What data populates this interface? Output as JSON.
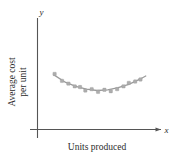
{
  "figure": {
    "name": "average-cost-per-unit-scatterplot",
    "background_color": "#ffffff"
  },
  "axes": {
    "x_axis_symbol": "x",
    "y_axis_symbol": "y",
    "x_axis_title": "Units produced",
    "y_axis_title_line1": "Average cost",
    "y_axis_title_line2": "per unit",
    "axis_color": "#555555"
  },
  "chart_data": {
    "type": "scatter",
    "title": "",
    "xlabel": "Units produced",
    "ylabel": "Average cost per unit",
    "xlim": [
      0,
      10
    ],
    "ylim": [
      0,
      10
    ],
    "grid": false,
    "legend": null,
    "axis_tick_labels": {
      "x": [],
      "y": []
    },
    "point_color": "#adadad",
    "curve_color": "#9b9b9b",
    "series": [
      {
        "name": "observed average cost",
        "type": "scatter",
        "x": [
          1.0,
          1.7,
          2.3,
          2.9,
          3.4,
          3.9,
          4.5,
          5.1,
          5.7,
          6.3,
          6.9,
          7.5,
          8.0,
          8.6,
          9.1
        ],
        "y": [
          7.4,
          6.4,
          6.0,
          5.6,
          5.5,
          5.0,
          5.2,
          4.8,
          5.1,
          4.9,
          5.2,
          5.6,
          6.1,
          6.3,
          6.6
        ]
      },
      {
        "name": "fitted quadratic trend",
        "type": "line",
        "x": [
          0.9,
          2.0,
          3.0,
          4.0,
          5.0,
          6.0,
          7.0,
          8.0,
          9.0,
          9.6
        ],
        "y": [
          7.3,
          6.2,
          5.6,
          5.2,
          5.0,
          5.1,
          5.4,
          5.9,
          6.6,
          7.1
        ]
      }
    ]
  }
}
